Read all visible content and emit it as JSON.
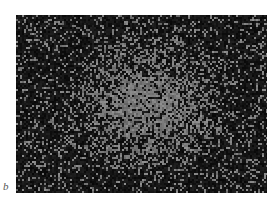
{
  "figure": {
    "panel_label": "b",
    "colors": {
      "background": "#0c0c0c",
      "speckle": "#8a8a8a",
      "center": "#7a7a7a"
    }
  }
}
